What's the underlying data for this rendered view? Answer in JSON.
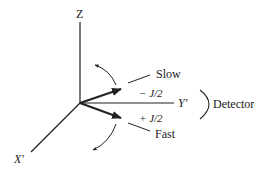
{
  "diagram": {
    "axes": {
      "z_label": "Z",
      "y_label": "Y′",
      "x_label": "X′"
    },
    "states": {
      "upper_label": "Slow",
      "upper_energy": "− J/2",
      "lower_label": "Fast",
      "lower_energy": "+ J/2"
    },
    "detector_label": "Detector",
    "colors": {
      "line": "#222222",
      "background": "#ffffff"
    }
  }
}
